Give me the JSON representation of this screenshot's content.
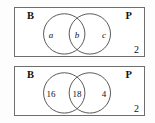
{
  "figure": {
    "type": "venn-diagram-pair",
    "diagrams": [
      {
        "id": "top",
        "left_set_label": "B",
        "right_set_label": "P",
        "corner_label": "2",
        "regions": [
          {
            "key": "left-only",
            "value": "a",
            "style": "italic"
          },
          {
            "key": "intersection",
            "value": "b",
            "style": "italic"
          },
          {
            "key": "right-only",
            "value": "c",
            "style": "italic"
          }
        ]
      },
      {
        "id": "bottom",
        "left_set_label": "B",
        "right_set_label": "P",
        "corner_label": "2",
        "regions": [
          {
            "key": "left-only",
            "value": "16",
            "style": "normal"
          },
          {
            "key": "intersection",
            "value": "18",
            "style": "normal"
          },
          {
            "key": "right-only",
            "value": "4",
            "style": "normal"
          }
        ]
      }
    ],
    "colors": {
      "box_border": "#6e6e6e",
      "circle_stroke": "#555555",
      "text": "#111111",
      "background": "#ffffff"
    }
  }
}
